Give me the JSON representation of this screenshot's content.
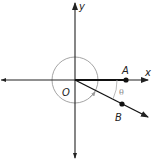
{
  "diagram": {
    "type": "angle-diagram",
    "labels": {
      "x_axis": "x",
      "y_axis": "y",
      "origin": "O",
      "point_a": "A",
      "point_b": "B",
      "angle": "θ"
    },
    "colors": {
      "axis": "#222222",
      "circle": "#9a9a9a",
      "angle_label": "#8a8a8a",
      "points": "#111111"
    }
  }
}
